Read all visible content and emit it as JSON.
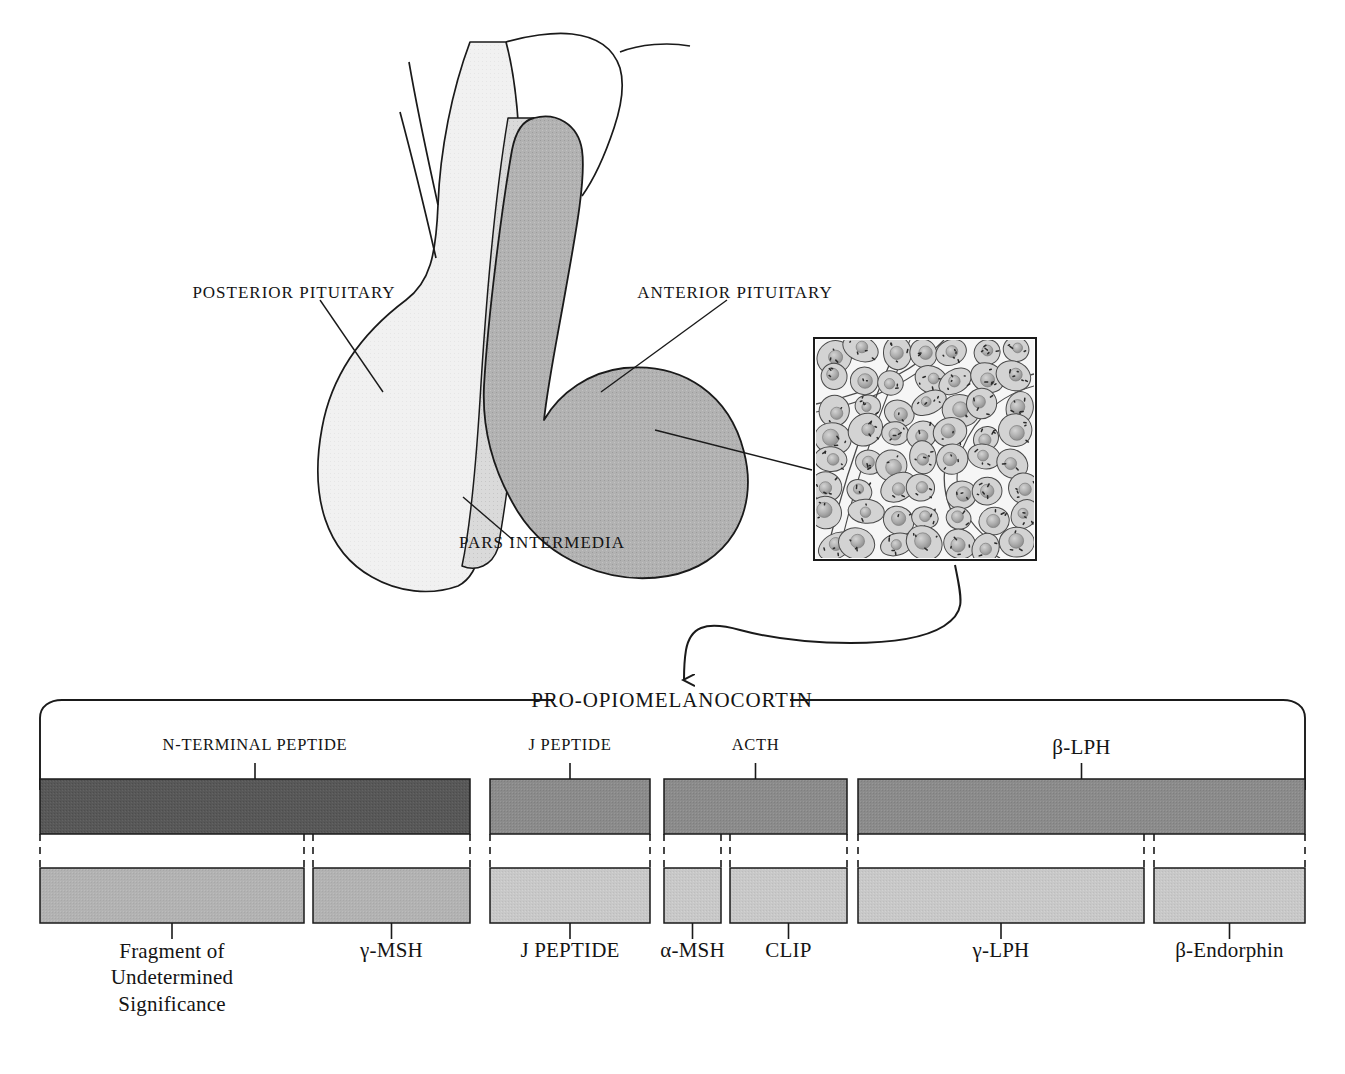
{
  "figure": {
    "domain": "anatomy-diagram",
    "anatomy_labels": [
      {
        "id": "posterior-pituitary",
        "text": "POSTERIOR PITUITARY"
      },
      {
        "id": "anterior-pituitary",
        "text": "ANTERIOR PITUITARY"
      },
      {
        "id": "pars-intermedia",
        "text": "PARS INTERMEDIA"
      }
    ],
    "inset": {
      "name": "anterior-pituitary-histology",
      "cell_count_visible": 62
    },
    "colors": {
      "posterior_fill": "#f0f0f0",
      "pars_intermedia_fill": "#d9d9d9",
      "anterior_fill": "#b0b0b0",
      "outline": "#1a1a1a",
      "precursor_bar": "#585858",
      "segment_bar": "#8a8a8a",
      "product_bar_dark": "#b0b0b0",
      "product_bar_light": "#c6c6c6"
    }
  },
  "pomc": {
    "title": "PRO-OPIOMELANOCORTIN",
    "precursor_segments": [
      {
        "label": "N-TERMINAL PEPTIDE",
        "x": 40,
        "w": 430,
        "shade": "#585858"
      },
      {
        "label": "J PEPTIDE",
        "x": 490,
        "w": 160,
        "shade": "#8a8a8a"
      },
      {
        "label": "ACTH",
        "x": 664,
        "w": 183,
        "shade": "#8a8a8a"
      },
      {
        "label": "β-LPH",
        "x": 858,
        "w": 447,
        "shade": "#8a8a8a"
      }
    ],
    "cleavage_products": [
      {
        "label": "Fragment of Undetermined Significance",
        "x": 40,
        "w": 264,
        "shade": "#b0b0b0"
      },
      {
        "label": "γ-MSH",
        "x": 313,
        "w": 157,
        "shade": "#b0b0b0"
      },
      {
        "label": "J PEPTIDE",
        "x": 490,
        "w": 160,
        "shade": "#c6c6c6"
      },
      {
        "label": "α-MSH",
        "x": 664,
        "w": 57,
        "shade": "#c6c6c6"
      },
      {
        "label": "CLIP",
        "x": 730,
        "w": 117,
        "shade": "#c6c6c6"
      },
      {
        "label": "γ-LPH",
        "x": 858,
        "w": 286,
        "shade": "#c6c6c6"
      },
      {
        "label": "β-Endorphin",
        "x": 1154,
        "w": 151,
        "shade": "#c6c6c6"
      }
    ]
  }
}
